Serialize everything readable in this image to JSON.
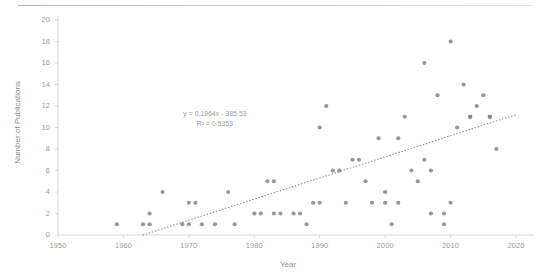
{
  "chart_data": {
    "type": "scatter",
    "title": "",
    "xlabel": "Year",
    "ylabel": "Number of Publications",
    "xlim": [
      1950,
      2020
    ],
    "ylim": [
      0,
      20
    ],
    "xticks": [
      1950,
      1960,
      1970,
      1980,
      1990,
      2000,
      2010,
      2020
    ],
    "yticks": [
      0,
      2,
      4,
      6,
      8,
      10,
      12,
      14,
      16,
      18,
      20
    ],
    "grid": false,
    "legend": false,
    "marker_color": "#808080",
    "trendline": {
      "type": "linear-dotted",
      "slope": 0.1964,
      "intercept": -385.53,
      "r_squared": 0.5353,
      "equation_label": "y = 0.1964x - 385.53",
      "r2_label": "R² = 0.5353",
      "color": "#9a9a9a",
      "x_start": 1963,
      "x_end": 2020
    },
    "points": [
      {
        "x": 1959,
        "y": 1
      },
      {
        "x": 1963,
        "y": 1
      },
      {
        "x": 1964,
        "y": 1
      },
      {
        "x": 1964,
        "y": 2
      },
      {
        "x": 1966,
        "y": 4
      },
      {
        "x": 1969,
        "y": 1
      },
      {
        "x": 1970,
        "y": 1
      },
      {
        "x": 1970,
        "y": 3
      },
      {
        "x": 1971,
        "y": 3
      },
      {
        "x": 1972,
        "y": 1
      },
      {
        "x": 1974,
        "y": 1
      },
      {
        "x": 1976,
        "y": 4
      },
      {
        "x": 1977,
        "y": 1
      },
      {
        "x": 1980,
        "y": 2
      },
      {
        "x": 1981,
        "y": 2
      },
      {
        "x": 1982,
        "y": 5
      },
      {
        "x": 1983,
        "y": 5
      },
      {
        "x": 1983,
        "y": 2
      },
      {
        "x": 1984,
        "y": 2
      },
      {
        "x": 1986,
        "y": 2
      },
      {
        "x": 1987,
        "y": 2
      },
      {
        "x": 1988,
        "y": 1
      },
      {
        "x": 1989,
        "y": 3
      },
      {
        "x": 1990,
        "y": 3
      },
      {
        "x": 1990,
        "y": 10
      },
      {
        "x": 1991,
        "y": 12
      },
      {
        "x": 1992,
        "y": 6
      },
      {
        "x": 1993,
        "y": 6
      },
      {
        "x": 1994,
        "y": 3
      },
      {
        "x": 1995,
        "y": 7
      },
      {
        "x": 1996,
        "y": 7
      },
      {
        "x": 1997,
        "y": 5
      },
      {
        "x": 1998,
        "y": 3
      },
      {
        "x": 1999,
        "y": 9
      },
      {
        "x": 2000,
        "y": 4
      },
      {
        "x": 2000,
        "y": 3
      },
      {
        "x": 2001,
        "y": 1
      },
      {
        "x": 2002,
        "y": 9
      },
      {
        "x": 2002,
        "y": 3
      },
      {
        "x": 2003,
        "y": 11
      },
      {
        "x": 2004,
        "y": 6
      },
      {
        "x": 2005,
        "y": 5
      },
      {
        "x": 2006,
        "y": 16
      },
      {
        "x": 2006,
        "y": 7
      },
      {
        "x": 2007,
        "y": 6
      },
      {
        "x": 2007,
        "y": 2
      },
      {
        "x": 2008,
        "y": 13
      },
      {
        "x": 2009,
        "y": 2
      },
      {
        "x": 2009,
        "y": 1
      },
      {
        "x": 2010,
        "y": 18
      },
      {
        "x": 2010,
        "y": 3
      },
      {
        "x": 2011,
        "y": 10
      },
      {
        "x": 2012,
        "y": 14
      },
      {
        "x": 2013,
        "y": 11
      },
      {
        "x": 2013,
        "y": 11
      },
      {
        "x": 2014,
        "y": 12
      },
      {
        "x": 2015,
        "y": 13
      },
      {
        "x": 2016,
        "y": 11
      },
      {
        "x": 2016,
        "y": 11
      },
      {
        "x": 2017,
        "y": 8
      }
    ]
  }
}
